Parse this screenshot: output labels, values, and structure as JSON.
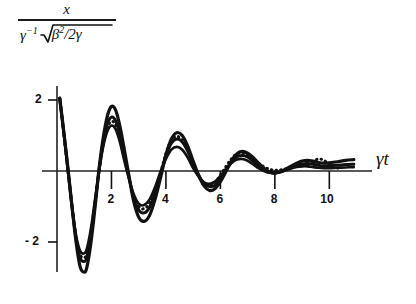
{
  "figure": {
    "background_color": "#ffffff",
    "ink_color": "#111111"
  },
  "axis_labels": {
    "y_numerator": "x",
    "y_denominator_gamma": "γ",
    "y_denominator_exp": "−1",
    "y_denominator_beta": "β",
    "y_denominator_beta_exp": "2",
    "y_denominator_divisor": "/2γ",
    "x_axis": "γt"
  },
  "ticks": {
    "x": [
      {
        "value": 2,
        "label": "2"
      },
      {
        "value": 4,
        "label": "4"
      },
      {
        "value": 6,
        "label": "6"
      },
      {
        "value": 8,
        "label": "8"
      },
      {
        "value": 10,
        "label": "10"
      }
    ],
    "y": [
      {
        "value": 2,
        "label": "2"
      },
      {
        "value": -2,
        "label": "- 2"
      }
    ]
  },
  "chart_data": {
    "type": "line",
    "title": "",
    "subtitle": "",
    "xlabel": "γt",
    "ylabel": "x / (γ⁻¹√(β²/2γ))",
    "xlim": [
      0,
      11.2
    ],
    "ylim": [
      -3.0,
      2.4
    ],
    "grid": false,
    "legend_position": "none",
    "annotations": [],
    "series": [
      {
        "name": "outer-solid",
        "style": "solid",
        "linewidth": 3.2,
        "x": [
          0.1,
          0.25,
          0.4,
          0.55,
          0.7,
          0.85,
          1.0,
          1.1,
          1.25,
          1.4,
          1.55,
          1.7,
          1.85,
          2.0,
          2.15,
          2.3,
          2.45,
          2.6,
          2.8,
          3.0,
          3.2,
          3.4,
          3.6,
          3.8,
          4.0,
          4.2,
          4.4,
          4.6,
          4.8,
          5.0,
          5.2,
          5.4,
          5.6,
          5.8,
          6.0,
          6.2,
          6.4,
          6.6,
          6.8,
          7.0,
          7.2,
          7.4,
          7.6,
          7.8,
          8.0,
          8.2,
          8.4,
          8.6,
          8.8,
          9.0,
          9.2,
          9.4,
          9.6,
          9.8,
          10.0,
          10.3,
          10.6,
          10.9
        ],
        "y": [
          2.05,
          1.1,
          0.1,
          -1.0,
          -2.0,
          -2.7,
          -2.85,
          -2.7,
          -2.0,
          -1.0,
          0.1,
          0.95,
          1.55,
          1.82,
          1.72,
          1.3,
          0.7,
          0.05,
          -0.8,
          -1.3,
          -1.42,
          -1.25,
          -0.8,
          -0.2,
          0.45,
          0.9,
          1.08,
          1.0,
          0.7,
          0.28,
          -0.12,
          -0.42,
          -0.55,
          -0.5,
          -0.3,
          -0.02,
          0.28,
          0.48,
          0.55,
          0.5,
          0.38,
          0.22,
          0.08,
          -0.02,
          -0.05,
          -0.02,
          0.05,
          0.14,
          0.22,
          0.28,
          0.3,
          0.28,
          0.24,
          0.22,
          0.23,
          0.26,
          0.3,
          0.32
        ]
      },
      {
        "name": "middle-solid",
        "style": "solid",
        "linewidth": 3.0,
        "x": [
          0.1,
          0.25,
          0.4,
          0.55,
          0.7,
          0.85,
          1.0,
          1.1,
          1.25,
          1.4,
          1.55,
          1.7,
          1.85,
          2.0,
          2.15,
          2.3,
          2.45,
          2.6,
          2.8,
          3.0,
          3.2,
          3.4,
          3.6,
          3.8,
          4.0,
          4.2,
          4.4,
          4.6,
          4.8,
          5.0,
          5.2,
          5.4,
          5.6,
          5.8,
          6.0,
          6.2,
          6.4,
          6.6,
          6.8,
          7.0,
          7.2,
          7.4,
          7.6,
          7.8,
          8.0,
          8.2,
          8.4,
          8.6,
          8.8,
          9.0,
          9.2,
          9.4,
          9.6,
          9.8,
          10.0,
          10.3,
          10.6,
          10.9
        ],
        "y": [
          2.05,
          1.08,
          0.05,
          -1.0,
          -1.9,
          -2.45,
          -2.55,
          -2.42,
          -1.8,
          -0.9,
          0.05,
          0.82,
          1.32,
          1.52,
          1.42,
          1.05,
          0.52,
          -0.02,
          -0.7,
          -1.1,
          -1.18,
          -1.02,
          -0.62,
          -0.1,
          0.42,
          0.78,
          0.9,
          0.82,
          0.56,
          0.2,
          -0.12,
          -0.35,
          -0.44,
          -0.4,
          -0.22,
          0.02,
          0.24,
          0.4,
          0.44,
          0.4,
          0.28,
          0.15,
          0.04,
          -0.04,
          -0.06,
          -0.03,
          0.03,
          0.1,
          0.16,
          0.2,
          0.21,
          0.19,
          0.16,
          0.14,
          0.15,
          0.16,
          0.18,
          0.19
        ]
      },
      {
        "name": "inner-solid",
        "style": "solid",
        "linewidth": 2.6,
        "x": [
          0.1,
          0.25,
          0.4,
          0.55,
          0.7,
          0.85,
          1.0,
          1.1,
          1.25,
          1.4,
          1.55,
          1.7,
          1.85,
          2.0,
          2.15,
          2.3,
          2.45,
          2.6,
          2.8,
          3.0,
          3.2,
          3.4,
          3.6,
          3.8,
          4.0,
          4.2,
          4.4,
          4.6,
          4.8,
          5.0,
          5.2,
          5.4,
          5.6,
          5.8,
          6.0,
          6.2,
          6.4,
          6.6,
          6.8,
          7.0,
          7.2,
          7.4,
          7.6,
          7.8,
          8.0,
          8.2,
          8.4,
          8.6,
          8.8,
          9.0,
          9.2,
          9.4,
          9.6,
          9.8,
          10.0,
          10.3,
          10.6,
          10.9
        ],
        "y": [
          2.05,
          1.05,
          0.02,
          -0.98,
          -1.8,
          -2.25,
          -2.32,
          -2.18,
          -1.6,
          -0.78,
          0.02,
          0.7,
          1.12,
          1.28,
          1.18,
          0.84,
          0.36,
          -0.1,
          -0.62,
          -0.92,
          -0.96,
          -0.8,
          -0.46,
          -0.02,
          0.34,
          0.6,
          0.68,
          0.6,
          0.38,
          0.08,
          -0.16,
          -0.32,
          -0.36,
          -0.3,
          -0.14,
          0.06,
          0.22,
          0.32,
          0.34,
          0.29,
          0.19,
          0.08,
          0.0,
          -0.05,
          -0.06,
          -0.03,
          0.02,
          0.07,
          0.11,
          0.13,
          0.13,
          0.11,
          0.09,
          0.08,
          0.08,
          0.09,
          0.1,
          0.11
        ]
      },
      {
        "name": "dotted-curve",
        "style": "dotted",
        "linewidth": 3.0,
        "x": [
          0.1,
          0.25,
          0.4,
          0.55,
          0.7,
          0.85,
          1.0,
          1.1,
          1.25,
          1.4,
          1.55,
          1.7,
          1.85,
          2.0,
          2.15,
          2.3,
          2.45,
          2.6,
          2.8,
          3.0,
          3.2,
          3.4,
          3.6,
          3.8,
          4.0,
          4.2,
          4.4,
          4.6,
          4.8,
          5.0,
          5.2,
          5.4,
          5.6,
          5.8,
          6.0,
          6.2,
          6.4,
          6.6,
          6.8,
          7.0,
          7.2,
          7.4,
          7.6,
          7.8,
          8.0,
          8.2,
          8.4,
          8.6,
          8.8,
          9.0,
          9.2,
          9.4,
          9.6,
          9.8,
          10.0,
          10.2,
          10.4
        ],
        "y": [
          2.05,
          1.07,
          0.04,
          -0.99,
          -1.86,
          -2.36,
          -2.44,
          -2.3,
          -1.7,
          -0.84,
          0.04,
          0.76,
          1.22,
          1.4,
          1.3,
          0.95,
          0.44,
          -0.06,
          -0.66,
          -1.0,
          -1.06,
          -0.9,
          -0.54,
          -0.06,
          0.5,
          0.86,
          0.98,
          0.86,
          0.58,
          0.18,
          -0.14,
          -0.34,
          -0.4,
          -0.32,
          -0.12,
          0.12,
          0.34,
          0.48,
          0.5,
          0.44,
          0.34,
          0.22,
          0.12,
          0.05,
          0.02,
          0.03,
          0.06,
          0.1,
          0.13,
          0.15,
          0.18,
          0.26,
          0.34,
          0.3,
          0.18,
          0.1,
          0.08
        ]
      }
    ]
  }
}
